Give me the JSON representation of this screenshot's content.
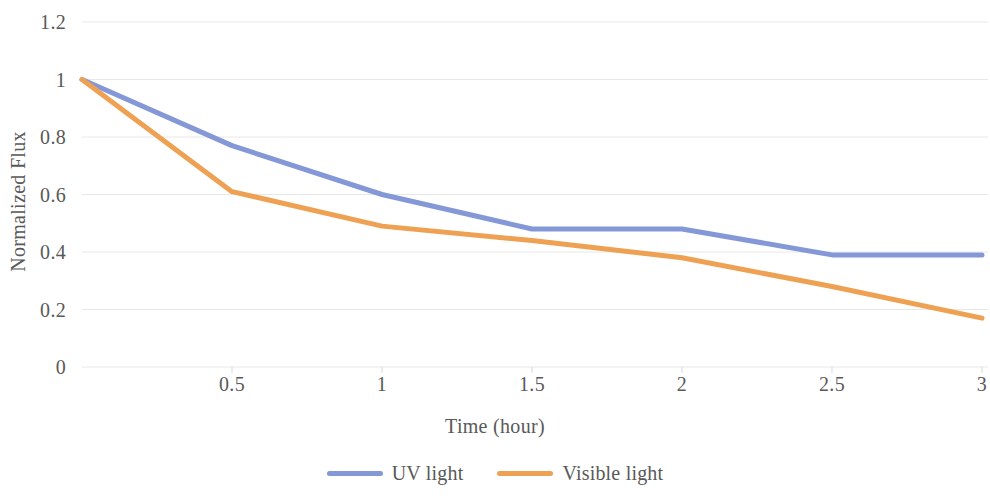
{
  "chart_data": {
    "type": "line",
    "title": "",
    "xlabel": "Time (hour)",
    "ylabel": "Normalized Flux",
    "x": [
      0,
      0.5,
      1,
      1.5,
      2,
      2.5,
      3
    ],
    "xlim": [
      0,
      3
    ],
    "ylim": [
      0,
      1.2
    ],
    "x_ticks": [
      "0.5",
      "1",
      "1.5",
      "2",
      "2.5",
      "3"
    ],
    "x_tick_values": [
      0.5,
      1,
      1.5,
      2,
      2.5,
      3
    ],
    "y_ticks": [
      "0",
      "0.2",
      "0.4",
      "0.6",
      "0.8",
      "1",
      "1.2"
    ],
    "y_tick_values": [
      0,
      0.2,
      0.4,
      0.6,
      0.8,
      1,
      1.2
    ],
    "grid": "horizontal",
    "legend_position": "bottom",
    "series": [
      {
        "name": "UV light",
        "color": "#8497d6",
        "values": [
          1.0,
          0.77,
          0.6,
          0.48,
          0.48,
          0.39,
          0.39
        ]
      },
      {
        "name": "Visible light",
        "color": "#efa153",
        "values": [
          1.0,
          0.61,
          0.49,
          0.44,
          0.38,
          0.28,
          0.17
        ]
      }
    ]
  },
  "axes": {
    "x_title": "Time (hour)",
    "y_title": "Normalized Flux"
  },
  "legend": {
    "items": [
      {
        "label": "UV light",
        "color": "#8497d6"
      },
      {
        "label": "Visible light",
        "color": "#efa153"
      }
    ]
  },
  "colors": {
    "uv_light": "#8497d6",
    "visible_light": "#efa153",
    "gridline": "#e8e8e8",
    "text": "#595959",
    "background": "#ffffff"
  }
}
